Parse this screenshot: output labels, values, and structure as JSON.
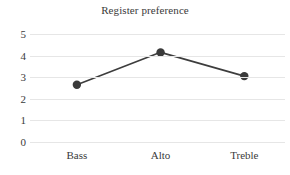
{
  "chart_data": {
    "type": "line",
    "title": "Register preference",
    "xlabel": "",
    "ylabel": "",
    "categories": [
      "Bass",
      "Alto",
      "Treble"
    ],
    "values": [
      2.65,
      4.15,
      3.05
    ],
    "series": [
      {
        "name": "Register preference",
        "values": [
          2.65,
          4.15,
          3.05
        ]
      }
    ],
    "ylim": [
      0,
      5
    ],
    "yticks": [
      5,
      4,
      3,
      2,
      1,
      0
    ],
    "ytick_labels": [
      "5",
      "4",
      "3",
      "2",
      "1",
      "0"
    ],
    "xtick_labels": [
      "Bass",
      "Alto",
      "Treble"
    ],
    "grid": true,
    "grid_axis": "y",
    "legend": false,
    "legend_position": "none",
    "colors": {
      "line": "#3d3d3d",
      "marker": "#3a3a3a",
      "gridline": "#e6e6e6",
      "text": "#3a3a3a",
      "background": "#ffffff"
    },
    "marker": "circle",
    "line_width": 1.6,
    "marker_size": 4.2
  }
}
